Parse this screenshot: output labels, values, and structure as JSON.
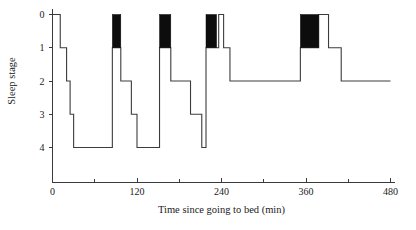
{
  "chart_data": {
    "type": "line",
    "title": "",
    "xlabel": "Time since going to bed (min)",
    "ylabel": "Sleep stage",
    "xlim": [
      0,
      480
    ],
    "ylim": [
      0,
      4
    ],
    "y_inverted": true,
    "grid": false,
    "legend": "none",
    "x_ticks": [
      0,
      60,
      120,
      180,
      240,
      300,
      360,
      420,
      480
    ],
    "x_tick_labels": [
      "0",
      "",
      "120",
      "",
      "240",
      "",
      "360",
      "",
      "480"
    ],
    "x_major_labels": [
      "0",
      "120",
      "240",
      "360",
      "480"
    ],
    "y_ticks": [
      0,
      1,
      2,
      3,
      4
    ],
    "y_tick_labels": [
      "0",
      "1",
      "2",
      "3",
      "4"
    ],
    "series": [
      {
        "name": "sleep stage",
        "style": "step-post",
        "points": [
          {
            "t": 0,
            "stage": 0
          },
          {
            "t": 11,
            "stage": 0
          },
          {
            "t": 11,
            "stage": 1
          },
          {
            "t": 20,
            "stage": 1
          },
          {
            "t": 20,
            "stage": 2
          },
          {
            "t": 25,
            "stage": 2
          },
          {
            "t": 25,
            "stage": 3
          },
          {
            "t": 30,
            "stage": 3
          },
          {
            "t": 30,
            "stage": 4
          },
          {
            "t": 85,
            "stage": 4
          },
          {
            "t": 85,
            "stage": 1
          },
          {
            "t": 97,
            "stage": 1
          },
          {
            "t": 97,
            "stage": 2
          },
          {
            "t": 112,
            "stage": 2
          },
          {
            "t": 112,
            "stage": 3
          },
          {
            "t": 120,
            "stage": 3
          },
          {
            "t": 120,
            "stage": 4
          },
          {
            "t": 152,
            "stage": 4
          },
          {
            "t": 152,
            "stage": 1
          },
          {
            "t": 168,
            "stage": 1
          },
          {
            "t": 168,
            "stage": 2
          },
          {
            "t": 196,
            "stage": 2
          },
          {
            "t": 196,
            "stage": 3
          },
          {
            "t": 212,
            "stage": 3
          },
          {
            "t": 212,
            "stage": 4
          },
          {
            "t": 218,
            "stage": 4
          },
          {
            "t": 218,
            "stage": 1
          },
          {
            "t": 236,
            "stage": 1
          },
          {
            "t": 236,
            "stage": 0
          },
          {
            "t": 243,
            "stage": 0
          },
          {
            "t": 243,
            "stage": 1
          },
          {
            "t": 252,
            "stage": 1
          },
          {
            "t": 252,
            "stage": 2
          },
          {
            "t": 352,
            "stage": 2
          },
          {
            "t": 352,
            "stage": 1
          },
          {
            "t": 378,
            "stage": 1
          },
          {
            "t": 378,
            "stage": 0
          },
          {
            "t": 392,
            "stage": 0
          },
          {
            "t": 392,
            "stage": 1
          },
          {
            "t": 410,
            "stage": 1
          },
          {
            "t": 410,
            "stage": 2
          },
          {
            "t": 480,
            "stage": 2
          }
        ]
      }
    ],
    "rem_periods": [
      {
        "start": 85,
        "end": 97,
        "stage_top": 0,
        "stage_bottom": 1
      },
      {
        "start": 152,
        "end": 168,
        "stage_top": 0,
        "stage_bottom": 1
      },
      {
        "start": 218,
        "end": 233,
        "stage_top": 0,
        "stage_bottom": 1
      },
      {
        "start": 352,
        "end": 378,
        "stage_top": 0,
        "stage_bottom": 1
      }
    ]
  },
  "colors": {
    "axis": "#3a3a3a",
    "trace": "#3c3c3c",
    "rem": "#0d0d0d",
    "background": "#ffffff",
    "text": "#1a1a1a"
  }
}
